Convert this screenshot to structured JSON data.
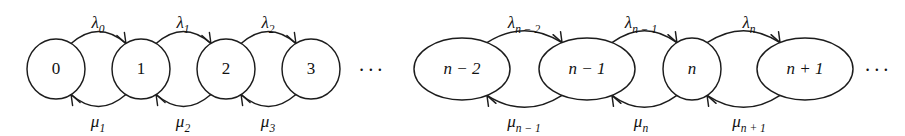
{
  "figure": {
    "background_color": "#ffffff",
    "stroke_color": "#1c1c1c",
    "text_color": "#111111"
  },
  "chart_data": {
    "type": "diagram",
    "diagram_kind": "state-transition-diagram",
    "states": [
      {
        "id": "s0",
        "label": "0",
        "cx": 56,
        "cy": 69,
        "rx": 29,
        "ry": 30,
        "group": "left"
      },
      {
        "id": "s1",
        "label": "1",
        "cx": 141,
        "cy": 69,
        "rx": 29,
        "ry": 30,
        "group": "left"
      },
      {
        "id": "s2",
        "label": "2",
        "cx": 226,
        "cy": 69,
        "rx": 29,
        "ry": 30,
        "group": "left"
      },
      {
        "id": "s3",
        "label": "3",
        "cx": 311,
        "cy": 69,
        "rx": 29,
        "ry": 30,
        "group": "left"
      },
      {
        "id": "sn-2",
        "label": "n − 2",
        "cx": 462,
        "cy": 69,
        "rx": 48,
        "ry": 31,
        "group": "right"
      },
      {
        "id": "sn-1",
        "label": "n − 1",
        "cx": 587,
        "cy": 69,
        "rx": 48,
        "ry": 31,
        "group": "right"
      },
      {
        "id": "sn",
        "label": "n",
        "cx": 692,
        "cy": 69,
        "rx": 29,
        "ry": 31,
        "group": "right"
      },
      {
        "id": "sn+1",
        "label": "n + 1",
        "cx": 805,
        "cy": 69,
        "rx": 48,
        "ry": 31,
        "group": "right"
      }
    ],
    "transitions_forward": [
      {
        "from": "s0",
        "to": "s1",
        "symbol": "λ",
        "subscript": "0",
        "label": "λ₀",
        "label_x": 98,
        "label_y": 28,
        "kind": "birth-rate"
      },
      {
        "from": "s1",
        "to": "s2",
        "symbol": "λ",
        "subscript": "1",
        "label": "λ₁",
        "label_x": 183,
        "label_y": 28,
        "kind": "birth-rate"
      },
      {
        "from": "s2",
        "to": "s3",
        "symbol": "λ",
        "subscript": "2",
        "label": "λ₂",
        "label_x": 268,
        "label_y": 28,
        "kind": "birth-rate"
      },
      {
        "from": "sn-2",
        "to": "sn-1",
        "symbol": "λ",
        "subscript": "n − 2",
        "label": "λₙ₋₂",
        "label_x": 524,
        "label_y": 28,
        "kind": "birth-rate"
      },
      {
        "from": "sn-1",
        "to": "sn",
        "symbol": "λ",
        "subscript": "n − 1",
        "label": "λₙ₋₁",
        "label_x": 641,
        "label_y": 28,
        "kind": "birth-rate"
      },
      {
        "from": "sn",
        "to": "sn+1",
        "symbol": "λ",
        "subscript": "n",
        "label": "λₙ",
        "label_x": 749,
        "label_y": 28,
        "kind": "birth-rate"
      }
    ],
    "transitions_backward": [
      {
        "from": "s1",
        "to": "s0",
        "symbol": "μ",
        "subscript": "1",
        "label": "μ₁",
        "label_x": 98,
        "label_y": 127,
        "kind": "death-rate"
      },
      {
        "from": "s2",
        "to": "s1",
        "symbol": "μ",
        "subscript": "2",
        "label": "μ₂",
        "label_x": 183,
        "label_y": 127,
        "kind": "death-rate"
      },
      {
        "from": "s3",
        "to": "s2",
        "symbol": "μ",
        "subscript": "3",
        "label": "μ₃",
        "label_x": 268,
        "label_y": 127,
        "kind": "death-rate"
      },
      {
        "from": "sn-1",
        "to": "sn-2",
        "symbol": "μ",
        "subscript": "n − 1",
        "label": "μₙ₋₁",
        "label_x": 524,
        "label_y": 127,
        "kind": "death-rate"
      },
      {
        "from": "sn",
        "to": "sn-1",
        "symbol": "μ",
        "subscript": "n",
        "label": "μₙ",
        "label_x": 641,
        "label_y": 127,
        "kind": "death-rate"
      },
      {
        "from": "sn+1",
        "to": "sn",
        "symbol": "μ",
        "subscript": "n + 1",
        "label": "μₙ₊₁",
        "label_x": 749,
        "label_y": 127,
        "kind": "death-rate"
      }
    ],
    "ellipses": [
      {
        "id": "gap-middle",
        "label": "···",
        "x": 372,
        "y": 72
      },
      {
        "id": "gap-end",
        "label": "···",
        "x": 878,
        "y": 72
      }
    ]
  }
}
